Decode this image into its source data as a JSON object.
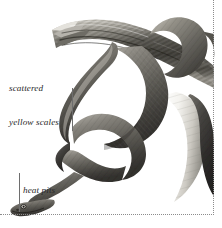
{
  "figure": {
    "palette": {
      "background": "#ffffff",
      "snake_dark": "#3a3a38",
      "snake_mid": "#6d6c66",
      "snake_light": "#a9a7a0",
      "snake_belly": "#f2f1ed",
      "branch_dark": "#46443f",
      "branch_mid": "#7d7b73",
      "branch_light": "#cfccc4",
      "leader_line": "#6e6e6e",
      "rule": "#8c8c8c",
      "label_text": "#2b2b2b"
    }
  },
  "annotations": [
    {
      "id": "scattered-yellow-scales",
      "line1": "scattered",
      "line2": "yellow scales"
    },
    {
      "id": "heat-pits",
      "line1": "heat pits"
    }
  ],
  "rules": {
    "right_label": "dotted-vertical-rule",
    "bottom_label": "dotted-horizontal-rule"
  }
}
